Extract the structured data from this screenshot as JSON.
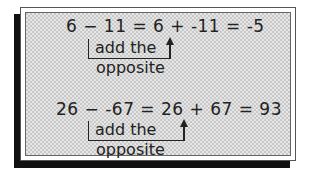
{
  "examples": [
    {
      "equation": "6 − 11 = 6 + -11 = -5",
      "label_line1": "add the",
      "label_line2": "opposite"
    },
    {
      "equation": "26 − -67 = 26 + 67 = 93",
      "label_line1": "add the",
      "label_line2": "opposite"
    }
  ]
}
